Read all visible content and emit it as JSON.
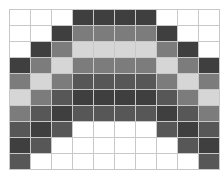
{
  "grid": {
    "columns": 10,
    "rows": 10,
    "palette": {
      "W": "#ffffff",
      "L": "#d6d6d6",
      "M": "#7c7c7c",
      "D": "#575757",
      "X": "#3f3f3f"
    },
    "cells": [
      "WWWXXXXWWW",
      "WWXMMMMXWW",
      "WXMLLLLMXW",
      "XMLMMMMLMX",
      "MLMDDDDMLM",
      "LMDXXXXDML",
      "MDXDDDDXDM",
      "DXDWWWWDXD",
      "XDWWWWWWDX",
      "DWWWWWWWWD"
    ]
  }
}
